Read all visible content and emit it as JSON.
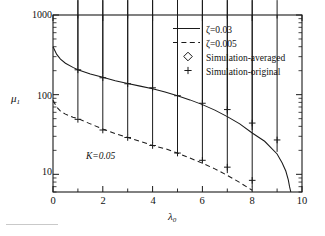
{
  "figure": {
    "background": "#ffffff",
    "frame_color": "#1a1a1a",
    "annotation": "K=0.05"
  },
  "axes": {
    "x": {
      "label": "λ0",
      "label_base": "λ",
      "label_sub": "0",
      "min": 0,
      "max": 10,
      "ticks": [
        0,
        2,
        4,
        6,
        8,
        10
      ],
      "tick_labels": [
        "0",
        "2",
        "4",
        "6",
        "8",
        "10"
      ],
      "minor_ticks": [
        1,
        3,
        5,
        7,
        9
      ],
      "scale": "linear"
    },
    "y": {
      "label": "μ1",
      "label_base": "μ",
      "label_sub": "1",
      "min": 6,
      "max": 1000,
      "ticks": [
        10,
        100,
        1000
      ],
      "tick_labels": [
        "10",
        "100",
        "1000"
      ],
      "scale": "log"
    }
  },
  "legend": {
    "position": "top-right",
    "items": [
      {
        "style": "solid-line",
        "label": "ζ=0.03"
      },
      {
        "style": "dashed-line",
        "label": "ζ=0.005"
      },
      {
        "style": "diamond-marker",
        "label": "Simulation-averaged"
      },
      {
        "style": "plus-marker",
        "label": "Simulation-original"
      }
    ]
  },
  "chart_data": {
    "type": "line",
    "title": "",
    "xlabel": "λ0",
    "ylabel": "μ1",
    "xlim": [
      0,
      10
    ],
    "ylim": [
      6,
      1000
    ],
    "yscale": "log",
    "grid": false,
    "legend_position": "top-right",
    "annotations": [
      {
        "text": "K=0.05",
        "x": 1.35,
        "y": 13
      }
    ],
    "series": [
      {
        "name": "ζ=0.03",
        "style": "solid",
        "x": [
          0.0,
          0.15,
          0.3,
          0.5,
          0.8,
          1.0,
          1.5,
          2.0,
          2.5,
          3.0,
          3.5,
          4.0,
          4.5,
          5.0,
          5.5,
          6.0,
          6.5,
          7.0,
          7.5,
          8.0,
          8.5,
          9.0,
          9.2,
          9.35,
          9.45,
          9.5,
          9.55
        ],
        "y": [
          400,
          320,
          280,
          248,
          220,
          205,
          182,
          165,
          150,
          138,
          128,
          119,
          108,
          97,
          86,
          75,
          64,
          53,
          43,
          33,
          26,
          18,
          14,
          11,
          8.5,
          7,
          6
        ]
      },
      {
        "name": "ζ=0.005",
        "style": "dashed",
        "x": [
          0.0,
          0.15,
          0.3,
          0.5,
          0.8,
          1.0,
          1.5,
          2.0,
          2.5,
          3.0,
          3.5,
          4.0,
          4.5,
          5.0,
          5.5,
          6.0,
          6.5,
          7.0,
          7.5,
          8.0
        ],
        "y": [
          85,
          70,
          62,
          57,
          52,
          50,
          43,
          37,
          32.5,
          29,
          26,
          23,
          21,
          18.5,
          16,
          13.8,
          11.7,
          9.7,
          7.9,
          6.3
        ]
      },
      {
        "name": "Simulation-averaged (ζ=0.03)",
        "style": "diamond",
        "x": [
          1,
          2,
          3,
          4,
          5,
          6,
          7,
          8,
          9
        ],
        "y": [
          200,
          160,
          133,
          120,
          92,
          72,
          50,
          32,
          17
        ]
      },
      {
        "name": "Simulation-original (ζ=0.03)",
        "style": "plus",
        "x": [
          1,
          2,
          3,
          4,
          5,
          6,
          7,
          8,
          9
        ],
        "y": [
          205,
          163,
          137,
          122,
          97,
          78,
          65,
          44,
          27
        ]
      },
      {
        "name": "Simulation-averaged (ζ=0.005)",
        "style": "diamond",
        "x": [
          1,
          2,
          3,
          4,
          5,
          6,
          7,
          8
        ],
        "y": [
          48,
          35,
          28,
          22,
          17.5,
          12.8,
          9.2,
          6.3
        ]
      },
      {
        "name": "Simulation-original (ζ=0.005)",
        "style": "plus",
        "x": [
          1,
          2,
          3,
          4,
          5,
          6,
          7,
          8
        ],
        "y": [
          49,
          36,
          29,
          23,
          18.5,
          15,
          12.3,
          8.4
        ]
      }
    ]
  }
}
